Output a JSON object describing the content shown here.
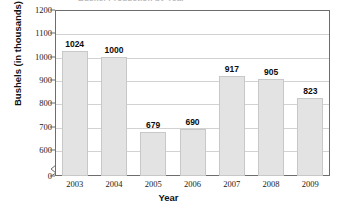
{
  "chart_data": {
    "type": "bar",
    "title": "",
    "xlabel": "Year",
    "ylabel": "Bushels (in thousands)",
    "categories": [
      "2003",
      "2004",
      "2005",
      "2006",
      "2007",
      "2008",
      "2009"
    ],
    "values": [
      1024,
      1000,
      679,
      690,
      917,
      905,
      823
    ],
    "series": [
      {
        "name": "Bushels",
        "values": [
          1024,
          1000,
          679,
          690,
          917,
          905,
          823
        ]
      }
    ],
    "ylim": [
      0,
      1200
    ],
    "y_ticks": [
      0,
      600,
      700,
      800,
      900,
      1000,
      1100,
      1200
    ],
    "y_tick_labels": [
      "0",
      "600",
      "700",
      "800",
      "900",
      "1000",
      "1100",
      "1200"
    ],
    "axis_break": true,
    "axis_break_between": [
      0,
      600
    ],
    "grid": true,
    "grid_axis": "y",
    "legend": "none",
    "data_labels": [
      "1024",
      "1000",
      "679",
      "690",
      "917",
      "905",
      "823"
    ],
    "bar_color": "#e3e3e3",
    "bar_border_color": "#c8c8c8",
    "grid_color": "#d2d2d2",
    "axis_color": "#6d6d6d",
    "text_color": "#111111"
  },
  "axis": {
    "y_title": "Bushels (in thousands)",
    "x_title": "Year"
  },
  "title_sliver": "Bushel Production by Year"
}
